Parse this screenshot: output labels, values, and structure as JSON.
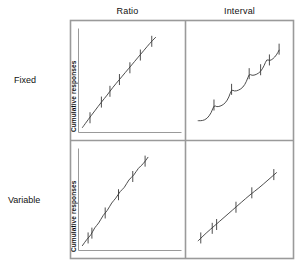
{
  "figure": {
    "title": "",
    "column_headers": [
      {
        "key": "ratio",
        "label": "Ratio"
      },
      {
        "key": "interval",
        "label": "Interval"
      }
    ],
    "row_headers": [
      {
        "key": "fixed",
        "label": "Fixed"
      },
      {
        "key": "variable",
        "label": "Variable"
      }
    ],
    "axis_titles": {
      "fixed_row": "Cumulative responses",
      "variable_row": "Cumulative responses"
    },
    "colors": {
      "frame": "#9a9a9a",
      "curve": "#3a3a3a",
      "tick": "#3a3a3a",
      "background": "#ffffff",
      "text": "#111111"
    }
  },
  "chart_data": {
    "type": "line",
    "xlabel": "Time",
    "ylabel": "Cumulative responses",
    "grid": false,
    "legend": "none",
    "axis_ticks_shown": false,
    "panels": [
      {
        "id": "fixed-ratio",
        "row": "Fixed",
        "column": "Ratio",
        "description": "Steep, steady, nearly linear responding with high rate; reinforcement marks evenly spaced along the line.",
        "xlim": [
          0,
          100
        ],
        "ylim": [
          0,
          100
        ],
        "curve": [
          [
            2,
            3
          ],
          [
            8,
            11
          ],
          [
            15,
            20
          ],
          [
            22,
            29
          ],
          [
            28,
            36
          ],
          [
            34,
            44
          ],
          [
            41,
            52
          ],
          [
            47,
            59
          ],
          [
            54,
            67
          ],
          [
            60,
            74
          ],
          [
            67,
            82
          ],
          [
            73,
            89
          ],
          [
            79,
            95
          ]
        ],
        "reinforcement_marks": [
          {
            "x": 10,
            "y": 13
          },
          {
            "x": 22,
            "y": 29
          },
          {
            "x": 31,
            "y": 40
          },
          {
            "x": 41,
            "y": 52
          },
          {
            "x": 52,
            "y": 64
          },
          {
            "x": 63,
            "y": 77
          },
          {
            "x": 75,
            "y": 91
          }
        ]
      },
      {
        "id": "fixed-interval",
        "row": "Fixed",
        "column": "Interval",
        "description": "Scalloped pattern: post-reinforcement pause then accelerating responding up to each reinforcement.",
        "xlim": [
          0,
          100
        ],
        "ylim": [
          0,
          100
        ],
        "curve": [
          [
            3,
            10
          ],
          [
            8,
            10
          ],
          [
            13,
            12
          ],
          [
            18,
            18
          ],
          [
            21,
            26
          ],
          [
            24,
            24
          ],
          [
            29,
            25
          ],
          [
            34,
            28
          ],
          [
            38,
            34
          ],
          [
            41,
            42
          ],
          [
            44,
            40
          ],
          [
            49,
            41
          ],
          [
            54,
            44
          ],
          [
            58,
            50
          ],
          [
            61,
            58
          ],
          [
            64,
            56
          ],
          [
            69,
            57
          ],
          [
            74,
            60
          ],
          [
            78,
            66
          ],
          [
            81,
            73
          ],
          [
            84,
            71
          ],
          [
            88,
            73
          ],
          [
            92,
            77
          ],
          [
            95,
            82
          ]
        ],
        "reinforcement_marks": [
          {
            "x": 21,
            "y": 26
          },
          {
            "x": 41,
            "y": 42
          },
          {
            "x": 61,
            "y": 58
          },
          {
            "x": 74,
            "y": 62
          },
          {
            "x": 84,
            "y": 72
          },
          {
            "x": 95,
            "y": 83
          }
        ]
      },
      {
        "id": "variable-ratio",
        "row": "Variable",
        "column": "Ratio",
        "description": "High steady rate with slight irregular wobble; reinforcement marks irregularly spaced.",
        "xlim": [
          0,
          100
        ],
        "ylim": [
          0,
          100
        ],
        "curve": [
          [
            2,
            3
          ],
          [
            7,
            10
          ],
          [
            11,
            14
          ],
          [
            15,
            22
          ],
          [
            19,
            26
          ],
          [
            24,
            35
          ],
          [
            28,
            39
          ],
          [
            33,
            48
          ],
          [
            37,
            52
          ],
          [
            42,
            60
          ],
          [
            46,
            63
          ],
          [
            51,
            72
          ],
          [
            56,
            76
          ],
          [
            61,
            84
          ],
          [
            66,
            88
          ],
          [
            71,
            95
          ]
        ],
        "reinforcement_marks": [
          {
            "x": 8,
            "y": 11
          },
          {
            "x": 12,
            "y": 16
          },
          {
            "x": 26,
            "y": 37
          },
          {
            "x": 40,
            "y": 56
          },
          {
            "x": 55,
            "y": 75
          },
          {
            "x": 68,
            "y": 91
          }
        ]
      },
      {
        "id": "variable-interval",
        "row": "Variable",
        "column": "Interval",
        "description": "Low but very steady, nearly linear responding; reinforcement marks irregularly spaced.",
        "xlim": [
          0,
          100
        ],
        "ylim": [
          0,
          100
        ],
        "curve": [
          [
            3,
            8
          ],
          [
            12,
            16
          ],
          [
            22,
            24
          ],
          [
            32,
            32
          ],
          [
            42,
            40
          ],
          [
            52,
            48
          ],
          [
            62,
            56
          ],
          [
            72,
            63
          ],
          [
            82,
            71
          ],
          [
            92,
            79
          ]
        ],
        "reinforcement_marks": [
          {
            "x": 6,
            "y": 11
          },
          {
            "x": 19,
            "y": 21
          },
          {
            "x": 24,
            "y": 25
          },
          {
            "x": 46,
            "y": 43
          },
          {
            "x": 64,
            "y": 58
          },
          {
            "x": 89,
            "y": 77
          }
        ]
      }
    ]
  }
}
